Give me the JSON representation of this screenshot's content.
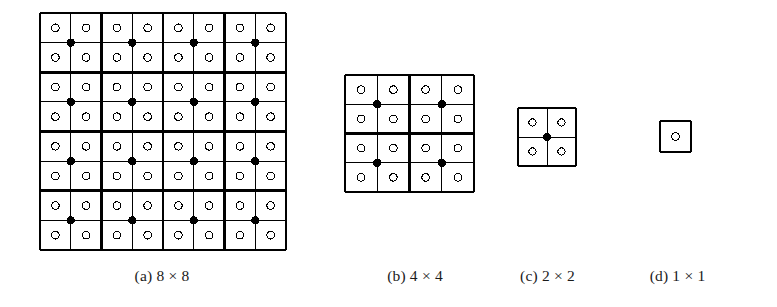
{
  "figure": {
    "background_color": "#ffffff",
    "line_color": "#000000",
    "open_marker_name": "open-circle",
    "filled_marker_name": "filled-dot",
    "panels": [
      {
        "id": "a",
        "caption": "(a) 8 × 8",
        "label": "(a)",
        "size_text": "8 × 8",
        "cols": 8,
        "rows": 8,
        "block_size": 2,
        "open_circle_count": 64,
        "filled_dot_count": 16,
        "x": 38,
        "y": 11,
        "width": 246,
        "height": 237,
        "thin_line_width": 1,
        "thick_line_width": 2.6
      },
      {
        "id": "b",
        "caption": "(b) 4 × 4",
        "label": "(b)",
        "size_text": "4 × 4",
        "cols": 4,
        "rows": 4,
        "block_size": 2,
        "open_circle_count": 16,
        "filled_dot_count": 4,
        "x": 343,
        "y": 73,
        "width": 129,
        "height": 117,
        "thin_line_width": 1,
        "thick_line_width": 2.6
      },
      {
        "id": "c",
        "caption": "(c) 2 × 2",
        "label": "(c)",
        "size_text": "2 × 2",
        "cols": 2,
        "rows": 2,
        "block_size": 2,
        "open_circle_count": 4,
        "filled_dot_count": 1,
        "x": 516,
        "y": 106,
        "width": 58,
        "height": 58,
        "thin_line_width": 1,
        "thick_line_width": 2.2
      },
      {
        "id": "d",
        "caption": "(d) 1 × 1",
        "label": "(d)",
        "size_text": "1 × 1",
        "cols": 1,
        "rows": 1,
        "block_size": 1,
        "open_circle_count": 1,
        "filled_dot_count": 0,
        "x": 658,
        "y": 119,
        "width": 31,
        "height": 31,
        "thin_line_width": 1,
        "thick_line_width": 2.0
      }
    ]
  },
  "chart_data": {
    "type": "diagram",
    "title": "",
    "panels": [
      {
        "name": "(a) 8 × 8",
        "grid": [
          8,
          8
        ],
        "open_circles": 64,
        "filled_dots": 16,
        "block": [
          2,
          2
        ]
      },
      {
        "name": "(b) 4 × 4",
        "grid": [
          4,
          4
        ],
        "open_circles": 16,
        "filled_dots": 4,
        "block": [
          2,
          2
        ]
      },
      {
        "name": "(c) 2 × 2",
        "grid": [
          2,
          2
        ],
        "open_circles": 4,
        "filled_dots": 1,
        "block": [
          2,
          2
        ]
      },
      {
        "name": "(d) 1 × 1",
        "grid": [
          1,
          1
        ],
        "open_circles": 1,
        "filled_dots": 0,
        "block": [
          1,
          1
        ]
      }
    ]
  }
}
